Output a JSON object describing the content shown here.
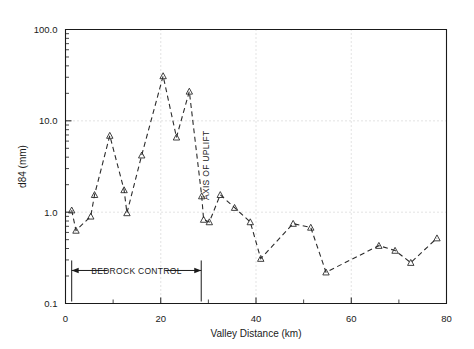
{
  "chart_data": {
    "type": "line",
    "title": "",
    "xlabel": "Valley Distance  (km)",
    "ylabel": "d84 (mm)",
    "xlim": [
      0,
      80
    ],
    "ylim": [
      0.1,
      100.0
    ],
    "yscale": "log",
    "xscale": "linear",
    "grid": true,
    "grid_style": "dotted",
    "legend": "none",
    "marker": "triangle-up-open",
    "linestyle": "dashed",
    "xticks": [
      0,
      20,
      40,
      60,
      80
    ],
    "xticklabels": [
      "0",
      "20",
      "40",
      "60",
      "80"
    ],
    "yticks": [
      0.1,
      1.0,
      10.0,
      100.0
    ],
    "yticklabels": [
      "0.1",
      "1.0",
      "10.0",
      "100.0"
    ],
    "series": [
      {
        "name": "d84",
        "x": [
          1.3,
          2.2,
          5.3,
          6.1,
          9.3,
          12.3,
          12.9,
          16.0,
          20.5,
          23.3,
          26.0,
          28.6,
          29.0,
          30.2,
          32.5,
          35.5,
          38.8,
          41.0,
          47.8,
          51.5,
          54.7,
          65.8,
          69.2,
          72.5,
          78.0
        ],
        "y": [
          1.05,
          0.63,
          0.9,
          1.55,
          6.9,
          1.75,
          0.98,
          4.2,
          31.0,
          6.6,
          21.0,
          1.5,
          0.83,
          0.78,
          1.55,
          1.12,
          0.78,
          0.31,
          0.75,
          0.68,
          0.22,
          0.43,
          0.38,
          0.28,
          0.52
        ]
      }
    ],
    "annotations": [
      {
        "name": "axis-of-uplift",
        "text": "AXIS OF UPLIFT",
        "x": 29.3,
        "orientation": "vertical"
      },
      {
        "name": "bedrock-control",
        "text": "BEDROCK CONTROL",
        "x_start": 1.3,
        "x_end": 28.5,
        "y": 0.23
      }
    ]
  }
}
